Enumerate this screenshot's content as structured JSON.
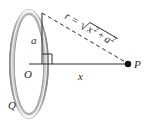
{
  "figure": {
    "background_color": "#ffffff",
    "ink_color": "#2b2b2b",
    "ring_color": "#9a9a9a",
    "ring_highlight_color": "#f2f2f2",
    "labels": {
      "charge": "Q",
      "radius": "a",
      "center": "O",
      "axial_distance": "x",
      "field_point": "P",
      "distance_expression": "r =",
      "radical_symbol": "√",
      "radicand_first_term": "x",
      "radicand_first_exponent": "2",
      "radicand_operator": "+",
      "radicand_second_term": "a",
      "radicand_second_exponent": "2"
    },
    "geometry": {
      "ring_center": {
        "x": 29,
        "y": 64
      },
      "ring_radius_x": 19,
      "ring_radius_y": 54,
      "ring_top_vertex": {
        "x": 42,
        "y": 13
      },
      "point_p": {
        "x": 128,
        "y": 64
      },
      "right_angle_marker": {
        "x": 42,
        "y": 64,
        "size": 10
      },
      "hypotenuse_style": "dashed",
      "axis_style": "solid",
      "radius_style": "solid"
    }
  }
}
